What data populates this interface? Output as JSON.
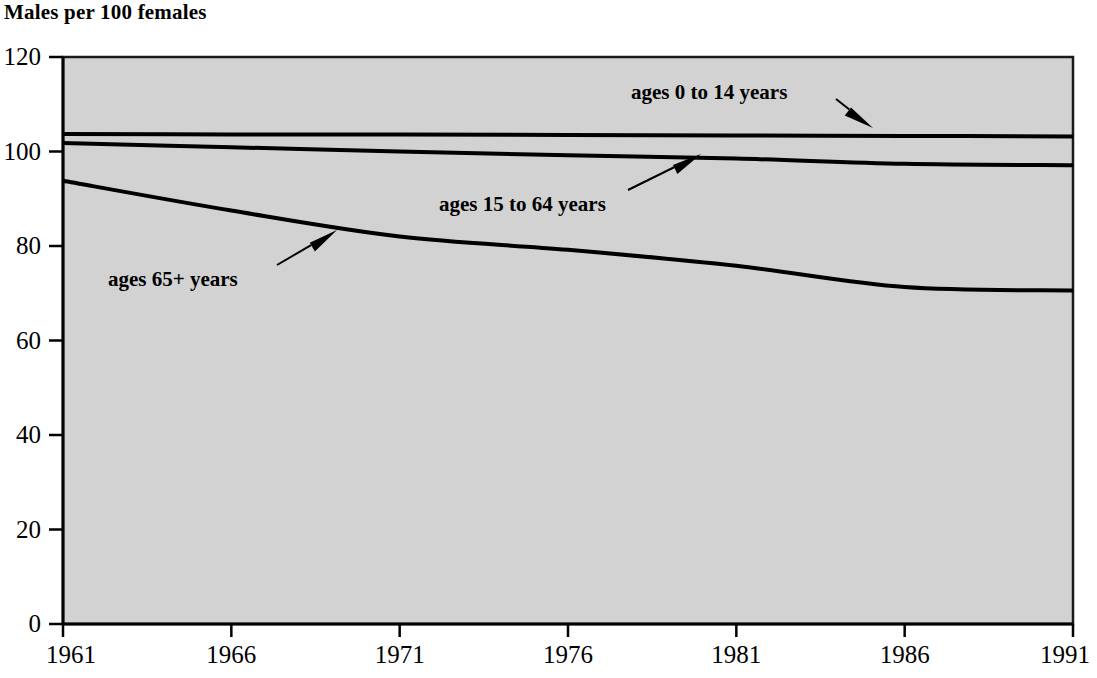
{
  "chart_data": {
    "type": "line",
    "title": "Males per 100 females",
    "subtitle": "",
    "xlabel": "",
    "ylabel": "Males per 100 females",
    "xlim": [
      1961,
      1991
    ],
    "ylim": [
      0,
      120
    ],
    "grid": false,
    "legend_position": "inline-annotations",
    "background_color": "#d2d2d2",
    "line_color": "#000000",
    "x_ticks": [
      "1961",
      "1966",
      "1971",
      "1976",
      "1981",
      "1986",
      "1991"
    ],
    "x_tick_values": [
      1961,
      1966,
      1971,
      1976,
      1981,
      1986,
      1991
    ],
    "y_ticks": [
      "0",
      "20",
      "40",
      "60",
      "80",
      "100",
      "120"
    ],
    "y_tick_values": [
      0,
      20,
      40,
      60,
      80,
      100,
      120
    ],
    "x": [
      1961,
      1966,
      1971,
      1976,
      1981,
      1986,
      1991
    ],
    "series": [
      {
        "name": "ages 0 to 14 years",
        "values": [
          103.7,
          103.6,
          103.6,
          103.5,
          103.4,
          103.3,
          103.2
        ]
      },
      {
        "name": "ages 15 to 64 years",
        "values": [
          101.8,
          100.9,
          100.0,
          99.2,
          98.5,
          97.4,
          97.1
        ]
      },
      {
        "name": "ages 65+ years",
        "values": [
          93.8,
          87.5,
          82.0,
          79.2,
          75.8,
          71.3,
          70.6
        ]
      }
    ],
    "annotations": [
      {
        "text": "ages 0 to 14 years",
        "label_x": 631,
        "label_y": 82,
        "arrow_from_x": 836,
        "arrow_from_y": 99,
        "arrow_to_x": 873,
        "arrow_to_y": 128
      },
      {
        "text": "ages 15 to 64 years",
        "label_x": 439,
        "label_y": 194,
        "arrow_from_x": 628,
        "arrow_from_y": 190,
        "arrow_to_x": 701,
        "arrow_to_y": 154
      },
      {
        "text": "ages 65+ years",
        "label_x": 108,
        "label_y": 269,
        "arrow_from_x": 277,
        "arrow_from_y": 265,
        "arrow_to_x": 337,
        "arrow_to_y": 230
      }
    ]
  }
}
